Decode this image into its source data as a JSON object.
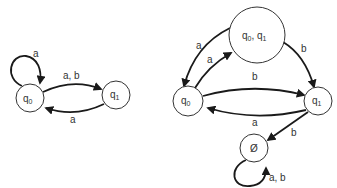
{
  "diagram": {
    "type": "state-machine",
    "left": {
      "title": "NFA",
      "states": [
        {
          "id": "q0",
          "label": "q",
          "sub": "0",
          "cx": 30,
          "cy": 98,
          "r": 14
        },
        {
          "id": "q1",
          "label": "q",
          "sub": "1",
          "cx": 116,
          "cy": 95,
          "r": 14
        }
      ],
      "transitions": [
        {
          "from": "q0",
          "to": "q0",
          "label": "a"
        },
        {
          "from": "q0",
          "to": "q1",
          "label": "a, b"
        },
        {
          "from": "q1",
          "to": "q0",
          "label": "a"
        }
      ]
    },
    "right": {
      "title": "DFA",
      "states": [
        {
          "id": "q01",
          "label": "q",
          "sub": "0",
          "label2": ", q",
          "sub2": "1",
          "cx": 257,
          "cy": 35,
          "r": 28
        },
        {
          "id": "q0",
          "label": "q",
          "sub": "0",
          "cx": 188,
          "cy": 101,
          "r": 15
        },
        {
          "id": "q1",
          "label": "q",
          "sub": "1",
          "cx": 318,
          "cy": 101,
          "r": 14
        },
        {
          "id": "empty",
          "label": "Ø",
          "cx": 254,
          "cy": 148,
          "r": 14
        }
      ],
      "transitions": [
        {
          "from": "q01",
          "to": "q0",
          "label": "a"
        },
        {
          "from": "q0",
          "to": "q01",
          "label": "a"
        },
        {
          "from": "q01",
          "to": "q1",
          "label": "b"
        },
        {
          "from": "q0",
          "to": "q1",
          "label": "b"
        },
        {
          "from": "q1",
          "to": "q0",
          "label": "a"
        },
        {
          "from": "q1",
          "to": "empty",
          "label": "b"
        },
        {
          "from": "empty",
          "to": "empty",
          "label": "a, b"
        }
      ]
    }
  }
}
